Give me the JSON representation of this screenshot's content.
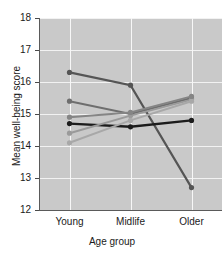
{
  "chart_data": {
    "type": "line",
    "title": "",
    "xlabel": "Age group",
    "ylabel": "Mean well-being score",
    "categories": [
      "Young",
      "Midlife",
      "Older"
    ],
    "ylim": [
      12,
      18
    ],
    "yticks": [
      12,
      13,
      14,
      15,
      16,
      17,
      18
    ],
    "grid": true,
    "legend": "none",
    "series": [
      {
        "name": "series-1-declining-dark",
        "values": [
          16.3,
          15.9,
          12.7
        ],
        "color": "#555555",
        "linewidth": 2.2,
        "marker": "o"
      },
      {
        "name": "series-2-rising-mid",
        "values": [
          15.4,
          15.0,
          15.5
        ],
        "color": "#6e6e6e",
        "linewidth": 2.0,
        "marker": "o"
      },
      {
        "name": "series-3-flat-black",
        "values": [
          14.7,
          14.6,
          14.8
        ],
        "color": "#1c1c1c",
        "linewidth": 2.4,
        "marker": "o"
      },
      {
        "name": "series-4-rising-light",
        "values": [
          14.4,
          14.95,
          15.45
        ],
        "color": "#9a9a9a",
        "linewidth": 2.0,
        "marker": "o"
      },
      {
        "name": "series-5-rising-lightest",
        "values": [
          14.1,
          14.8,
          15.4
        ],
        "color": "#a8a8a8",
        "linewidth": 2.0,
        "marker": "o"
      },
      {
        "name": "series-6-slight-rise-gray",
        "values": [
          14.9,
          15.05,
          15.55
        ],
        "color": "#858585",
        "linewidth": 2.0,
        "marker": "o"
      }
    ]
  },
  "axis": {
    "y_title": "Mean well-being score",
    "x_title": "Age group",
    "ytick_labels": [
      "18",
      "17",
      "16",
      "15",
      "14",
      "13",
      "12"
    ],
    "xtick_labels": [
      "Young",
      "Midlife",
      "Older"
    ]
  },
  "colors": {
    "plot_background": "#c9c9c9",
    "page_background": "#ffffff",
    "gridline": "#f2f2f2",
    "axis": "#5a5a5a",
    "text": "#1a1a1a"
  }
}
